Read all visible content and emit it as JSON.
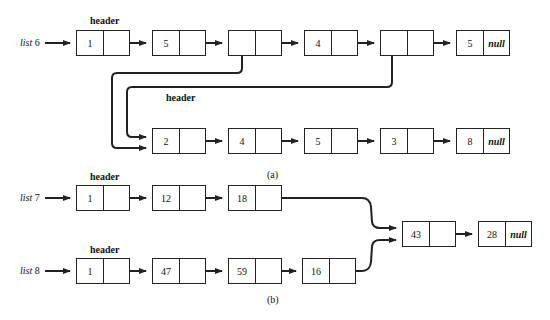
{
  "part_a": {
    "caption": "(a)",
    "list6": {
      "label": "list",
      "label_num": "6",
      "header_label": "header",
      "nodes": [
        {
          "value": "1",
          "next": ""
        },
        {
          "value": "5",
          "next": ""
        },
        {
          "value": "",
          "next": ""
        },
        {
          "value": "4",
          "next": ""
        },
        {
          "value": "",
          "next": ""
        },
        {
          "value": "5",
          "next": "null"
        }
      ]
    },
    "sublist": {
      "header_label": "header",
      "nodes": [
        {
          "value": "2",
          "next": ""
        },
        {
          "value": "4",
          "next": ""
        },
        {
          "value": "5",
          "next": ""
        },
        {
          "value": "3",
          "next": ""
        },
        {
          "value": "8",
          "next": "null"
        }
      ]
    }
  },
  "part_b": {
    "caption": "(b)",
    "list7": {
      "label": "list",
      "label_num": "7",
      "header_label": "header",
      "nodes": [
        {
          "value": "1",
          "next": ""
        },
        {
          "value": "12",
          "next": ""
        },
        {
          "value": "18",
          "next": ""
        }
      ]
    },
    "list8": {
      "label": "list",
      "label_num": "8",
      "header_label": "header",
      "nodes": [
        {
          "value": "1",
          "next": ""
        },
        {
          "value": "47",
          "next": ""
        },
        {
          "value": "59",
          "next": ""
        },
        {
          "value": "16",
          "next": ""
        }
      ]
    },
    "shared": {
      "nodes": [
        {
          "value": "43",
          "next": ""
        },
        {
          "value": "28",
          "next": "null"
        }
      ]
    }
  },
  "colors": {
    "line": "#222222",
    "background": "#ffffff"
  }
}
